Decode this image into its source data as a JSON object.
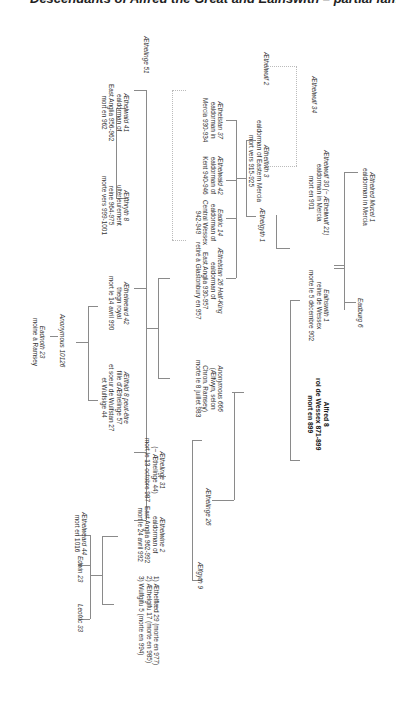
{
  "title": "Descendants of Alfred the Great and Ealhswith – partial family tree",
  "nodes": {
    "aethelred_mucel": {
      "name": "Æthelred Mucel 1",
      "l1": "ealdorman in Mercia"
    },
    "eadburg": {
      "name": "Eadburg 6"
    },
    "aethelwulf30": {
      "name": "Æthelwulf 30 (~ Æthelwulf 21)",
      "l1": "ealdorman in Mercia",
      "l2": "mort en 901"
    },
    "ealhswith": {
      "name": "Ealhswith 1",
      "l1": "reine de Wessex",
      "l2": "morte le 5 décembre 902"
    },
    "alfred": {
      "name": "Alfred 8",
      "l1": "roi de Wessex 871-899",
      "l2": "mort en 899"
    },
    "aethelwulf34": {
      "name": "Æthelwulf 34"
    },
    "aethelwulf2": {
      "name": "Æthelwulf 2"
    },
    "aethelfrith3": {
      "name": "Æthelfrith 3",
      "l1": "ealdorman of Eastern Mercia",
      "l2": "mort vers 915-925"
    },
    "aethelgyth1": {
      "name": "Æthelgyth 1"
    },
    "aethelstan37": {
      "name": "Æthelstan 37",
      "l1": "ealdorman in",
      "l2": "Mercia 930-934"
    },
    "aethelwald42": {
      "name": "Æthelwald 42",
      "l1": "ealdorman of",
      "l2": "Kent 940-946"
    },
    "eadric14": {
      "name": "Eadric 14",
      "l1": "ealdorman of",
      "l2": "Central Wessex",
      "l3": "942-949"
    },
    "aethelstan26": {
      "name": "Æthelstan 26 Half-King",
      "l1": "ealdorman of",
      "l2": "East Anglia 930-957",
      "l3": "retiré à Glastonbury en 957"
    },
    "aethelinge51": {
      "name": "Æthelinge 51"
    },
    "aethelwald41": {
      "name": "Æthelwald 41",
      "l1": "ealdorman of",
      "l2": "East Anglia 956-962",
      "l3": "mort en 962"
    },
    "aelfthryth8": {
      "name": "Ælfthryth 8",
      "l1": "ultérieurement",
      "l2": "reine 964-975",
      "l3": "morte vers 999-1001"
    },
    "aethelweard42": {
      "name": "Æthelweard 42",
      "l1": "thegn royal",
      "l2": "mort le 14 avril 990"
    },
    "aelfhild8": {
      "name": "Ælfhild 8 peut-être",
      "l1": "fille d'Æthelinge 57",
      "l2": "et soeur de Wulfstan 27",
      "l3": "et Wulfsige 44"
    },
    "anonymous666": {
      "name": "Anonymous 666",
      "l1": "(Ælfwyn, selon",
      "l2": "Chron. Ramsey)",
      "l3": "morte le 8 juillet 983"
    },
    "aethelinge26": {
      "name": "Æthelinge 26"
    },
    "aelfgyth9": {
      "name": "Ælfgyth 9"
    },
    "anonymous10126": {
      "name": "Anonymous 10126"
    },
    "eadnoth23": {
      "name": "Eadnoth 23",
      "l1": "moine à Ramsey"
    },
    "aethelinge31": {
      "name": "Æthelinge 31",
      "l1": "(~ Æthelinge 44)",
      "l2": "mort le 13 octobre 987"
    },
    "aethelwine2": {
      "name": "Æthelwine 2",
      "l1": "ealdorman of",
      "l2": "East Anglia 962-992",
      "l3": "mort le 24 avril 992"
    },
    "wives": {
      "l1": "1) Æthelflæd 29 (morte en 977)",
      "l2": "2) Æthelgifu 17 (morte en 985)",
      "l3": "3) Wulfgifu 5 (morte en 994)"
    },
    "aethelweard44": {
      "name": "Æthelweard 44",
      "l1": "mort en 1016"
    },
    "edwin23": {
      "name": "Edwin 23"
    },
    "leofric33": {
      "name": "Leofric 33"
    }
  }
}
